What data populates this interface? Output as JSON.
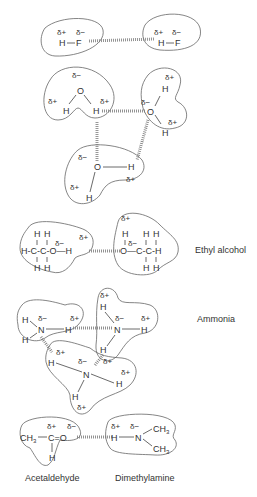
{
  "diagram": {
    "type": "hydrogen-bonding-illustration",
    "symbols": {
      "delta_plus": "δ+",
      "delta_minus": "δ−"
    },
    "groups": [
      {
        "name": "Hydrogen fluoride",
        "label": "",
        "molecules": [
          "H—F",
          "H—F"
        ],
        "bonds": "F···H hydrogen bond"
      },
      {
        "name": "Water",
        "label": "",
        "molecules": [
          "H2O",
          "H2O",
          "H2O"
        ]
      },
      {
        "name": "Ethyl alcohol",
        "label": "Ethyl alcohol",
        "molecules": [
          "CH3CH2OH",
          "CH3CH2OH"
        ]
      },
      {
        "name": "Ammonia",
        "label": "Ammonia",
        "molecules": [
          "NH3",
          "NH3",
          "NH3"
        ]
      },
      {
        "name": "Acetaldehyde-Dimethylamine",
        "label": "",
        "molecules": [
          "CH3CHO",
          "(CH3)2NH"
        ]
      }
    ],
    "labels": {
      "ethyl_alcohol": "Ethyl alcohol",
      "ammonia": "Ammonia",
      "acetaldehyde": "Acetaldehyde",
      "dimethylamine": "Dimethylamine"
    },
    "atoms": {
      "H": "H",
      "F": "F",
      "O": "O",
      "N": "N",
      "C": "C",
      "CH3": "CH",
      "sub3": "3"
    }
  }
}
